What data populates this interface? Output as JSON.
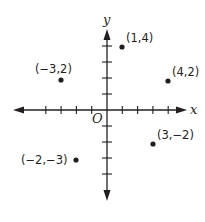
{
  "diagram": {
    "type": "coordinate-plane",
    "axes": {
      "x_label": "x",
      "y_label": "y",
      "origin_label": "O",
      "x_ticks": [
        -4,
        -3,
        -2,
        -1,
        1,
        2,
        3,
        4
      ],
      "y_ticks": [
        -4,
        -3,
        -2,
        -1,
        1,
        2,
        3,
        4
      ],
      "arrows": "both-ends",
      "color": "#231f20"
    },
    "points": [
      {
        "label": "(1,4)",
        "x": 1,
        "y": 4
      },
      {
        "label": "(−3,2)",
        "x": -3,
        "y": 2
      },
      {
        "label": "(4,2)",
        "x": 4,
        "y": 2
      },
      {
        "label": "(3,−2)",
        "x": 3,
        "y": -2
      },
      {
        "label": "(−2,−3)",
        "x": -2,
        "y": -3
      }
    ]
  }
}
